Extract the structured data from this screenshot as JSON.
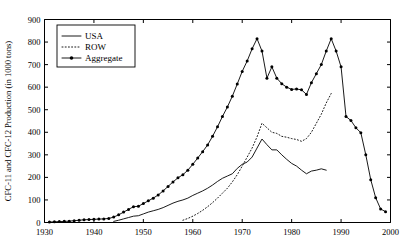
{
  "chart_data": {
    "type": "line",
    "title": "",
    "xlabel": "",
    "ylabel": "CFC-11 and CFC-12 Production (in 1000 tons)",
    "xlim": [
      1930,
      2000
    ],
    "ylim": [
      0,
      900
    ],
    "xticks": [
      1930,
      1940,
      1950,
      1960,
      1970,
      1980,
      1990,
      2000
    ],
    "xticklabels": [
      "1930",
      "1940",
      "1950",
      "1960",
      "1970",
      "1980",
      "1990",
      "2000"
    ],
    "yticks": [
      0,
      100,
      200,
      300,
      400,
      500,
      600,
      700,
      800,
      900
    ],
    "yticklabels": [
      "0",
      "100",
      "200",
      "300",
      "400",
      "500",
      "600",
      "700",
      "800",
      "900"
    ],
    "grid": false,
    "legend_position": "upper left",
    "legend": [
      "USA",
      "ROW",
      "Aggregate"
    ],
    "series": [
      {
        "name": "USA",
        "style": "solid",
        "marker": "none",
        "x": [
          1944,
          1945,
          1946,
          1947,
          1948,
          1949,
          1950,
          1951,
          1952,
          1953,
          1954,
          1955,
          1956,
          1957,
          1958,
          1959,
          1960,
          1961,
          1962,
          1963,
          1964,
          1965,
          1966,
          1967,
          1968,
          1969,
          1970,
          1971,
          1972,
          1973,
          1974,
          1975,
          1976,
          1977,
          1978,
          1979,
          1980,
          1981,
          1982,
          1983,
          1984,
          1985,
          1986,
          1987
        ],
        "y": [
          5,
          10,
          16,
          22,
          28,
          30,
          38,
          46,
          52,
          58,
          66,
          76,
          86,
          94,
          100,
          108,
          120,
          130,
          140,
          152,
          166,
          182,
          196,
          206,
          216,
          240,
          258,
          268,
          290,
          330,
          370,
          345,
          322,
          322,
          300,
          280,
          262,
          250,
          232,
          216,
          228,
          232,
          238,
          232
        ],
        "final_value": 232
      },
      {
        "name": "ROW",
        "style": "dotted",
        "marker": "none",
        "x": [
          1958,
          1959,
          1960,
          1961,
          1962,
          1963,
          1964,
          1965,
          1966,
          1967,
          1968,
          1969,
          1970,
          1971,
          1972,
          1973,
          1974,
          1975,
          1976,
          1977,
          1978,
          1979,
          1980,
          1981,
          1982,
          1983,
          1984,
          1985,
          1986,
          1987,
          1988
        ],
        "y": [
          10,
          18,
          28,
          40,
          54,
          70,
          88,
          108,
          130,
          152,
          180,
          212,
          250,
          290,
          330,
          380,
          440,
          420,
          400,
          395,
          382,
          378,
          372,
          368,
          360,
          372,
          400,
          440,
          480,
          530,
          572
        ],
        "final_value": 572
      },
      {
        "name": "Aggregate",
        "style": "solid",
        "marker": "filled-circle",
        "x": [
          1931,
          1932,
          1933,
          1934,
          1935,
          1936,
          1937,
          1938,
          1939,
          1940,
          1941,
          1942,
          1943,
          1944,
          1945,
          1946,
          1947,
          1948,
          1949,
          1950,
          1951,
          1952,
          1953,
          1954,
          1955,
          1956,
          1957,
          1958,
          1959,
          1960,
          1961,
          1962,
          1963,
          1964,
          1965,
          1966,
          1967,
          1968,
          1969,
          1970,
          1971,
          1972,
          1973,
          1974,
          1975,
          1976,
          1977,
          1978,
          1979,
          1980,
          1981,
          1982,
          1983,
          1984,
          1985,
          1986,
          1987,
          1988,
          1989,
          1990,
          1991,
          1992,
          1993,
          1994,
          1995,
          1996,
          1997,
          1998,
          1999
        ],
        "y": [
          2,
          3,
          4,
          5,
          6,
          8,
          10,
          12,
          13,
          14,
          15,
          16,
          18,
          24,
          34,
          46,
          58,
          70,
          72,
          84,
          96,
          108,
          122,
          140,
          160,
          180,
          198,
          212,
          232,
          258,
          286,
          314,
          344,
          382,
          424,
          470,
          512,
          560,
          614,
          670,
          716,
          770,
          815,
          760,
          640,
          690,
          640,
          615,
          600,
          590,
          592,
          588,
          568,
          620,
          660,
          700,
          760,
          815,
          760,
          690,
          470,
          452,
          420,
          398,
          300,
          190,
          110,
          60,
          48
        ],
        "peak_values": [
          {
            "year": 1974,
            "value": 815
          },
          {
            "year": 1988,
            "value": 815
          }
        ]
      }
    ]
  },
  "legend": {
    "items": [
      {
        "label": "USA",
        "style": "solid"
      },
      {
        "label": "ROW",
        "style": "dotted"
      },
      {
        "label": "Aggregate",
        "style": "solid-marker"
      }
    ]
  },
  "axes": {
    "ylabel": "CFC-11 and CFC-12 Production (in 1000 tons)"
  }
}
